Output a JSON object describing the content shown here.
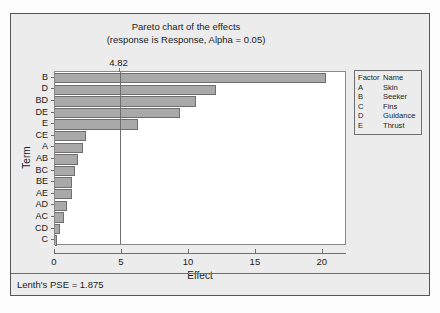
{
  "chart_data": {
    "type": "bar",
    "orientation": "horizontal",
    "title": "Pareto chart of the effects",
    "subtitle": "(response is Response, Alpha = 0.05)",
    "xlabel": "Effect",
    "ylabel": "Term",
    "xlim": [
      0,
      21.8
    ],
    "x_ticks": [
      0,
      5,
      10,
      15,
      20
    ],
    "x_tick_labels": [
      "0",
      "5",
      "10",
      "15",
      "20"
    ],
    "grid": false,
    "legend_position": "right-outside",
    "reference_line": {
      "value": 4.82,
      "label": "4.82"
    },
    "categories": [
      "B",
      "D",
      "BD",
      "DE",
      "E",
      "CE",
      "A",
      "AB",
      "BC",
      "BE",
      "AE",
      "AD",
      "AC",
      "CD",
      "C"
    ],
    "values": [
      20.2,
      12.0,
      10.5,
      9.3,
      6.2,
      2.3,
      2.1,
      1.7,
      1.5,
      1.3,
      1.25,
      0.9,
      0.7,
      0.35,
      0.15
    ],
    "bars": [
      {
        "term": "B",
        "effect": 20.2
      },
      {
        "term": "D",
        "effect": 12.0
      },
      {
        "term": "BD",
        "effect": 10.5
      },
      {
        "term": "DE",
        "effect": 9.3
      },
      {
        "term": "E",
        "effect": 6.2
      },
      {
        "term": "CE",
        "effect": 2.3
      },
      {
        "term": "A",
        "effect": 2.1
      },
      {
        "term": "AB",
        "effect": 1.7
      },
      {
        "term": "BC",
        "effect": 1.5
      },
      {
        "term": "BE",
        "effect": 1.3
      },
      {
        "term": "AE",
        "effect": 1.25
      },
      {
        "term": "AD",
        "effect": 0.9
      },
      {
        "term": "AC",
        "effect": 0.7
      },
      {
        "term": "CD",
        "effect": 0.35
      },
      {
        "term": "C",
        "effect": 0.15
      }
    ],
    "annotations": [
      "Lenth's PSE = 1.875"
    ],
    "colors": {
      "bar_fill": "#a9a9a9",
      "bar_stroke": "#6e6e6e",
      "panel_background": "#ececec",
      "plot_background": "#ffffff",
      "axis": "#6e6e6e",
      "text": "#1b1b1b"
    }
  },
  "legend": {
    "header": {
      "factor": "Factor",
      "name": "Name"
    },
    "rows": [
      {
        "factor": "A",
        "name": "Skin"
      },
      {
        "factor": "B",
        "name": "Seeker"
      },
      {
        "factor": "C",
        "name": "Fins"
      },
      {
        "factor": "D",
        "name": "Guidance"
      },
      {
        "factor": "E",
        "name": "Thrust"
      }
    ]
  },
  "footer": {
    "text": "Lenth's PSE = 1.875"
  }
}
